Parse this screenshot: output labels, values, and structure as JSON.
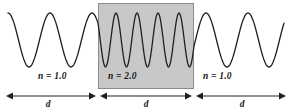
{
  "figure": {
    "background_color": "#ffffff",
    "width": 290,
    "height": 112
  },
  "slab": {
    "fill_color": "#c8c8c8",
    "border_color": "#8c8c8c",
    "x": 98,
    "y": 3,
    "width": 96,
    "height": 86
  },
  "wave": {
    "stroke_color": "#231f20",
    "stroke_width": 1.3,
    "baseline_y": 40,
    "amplitude": 27,
    "x_start": 8,
    "x_end": 284
  },
  "regions": [
    {
      "id": "left",
      "label": "n = 1.0",
      "index_of_refraction": 1.0,
      "wavelength_px": 42,
      "x_start": 8,
      "x_end": 98
    },
    {
      "id": "middle",
      "label": "n = 2.0",
      "index_of_refraction": 2.0,
      "wavelength_px": 21,
      "x_start": 98,
      "x_end": 194
    },
    {
      "id": "right",
      "label": "n = 1.0",
      "index_of_refraction": 1.0,
      "wavelength_px": 42,
      "x_start": 194,
      "x_end": 284
    }
  ],
  "dimensions": {
    "arrow_color": "#231f20",
    "arrow_y": 96,
    "items": [
      {
        "id": "dim-left",
        "label": "d",
        "x_start": 6,
        "x_end": 96
      },
      {
        "id": "dim-middle",
        "label": "d",
        "x_start": 100,
        "x_end": 192
      },
      {
        "id": "dim-right",
        "label": "d",
        "x_start": 196,
        "x_end": 286
      }
    ]
  },
  "chart_data": {
    "type": "line",
    "xlabel": "",
    "ylabel": "",
    "grid": false,
    "legend": "none",
    "annotations": [
      "n = 1.0",
      "n = 2.0",
      "n = 1.0",
      "d",
      "d",
      "d"
    ],
    "series": [
      {
        "name": "wave",
        "description": "Continuous sinusoid; wavelength halves inside the shaded slab where n = 2.0",
        "segments": [
          {
            "region": "left",
            "n": 1.0,
            "wavelength_px": 42,
            "x_range": [
              8,
              98
            ],
            "cycles": 2.14
          },
          {
            "region": "middle",
            "n": 2.0,
            "wavelength_px": 21,
            "x_range": [
              98,
              194
            ],
            "cycles": 4.57
          },
          {
            "region": "right",
            "n": 1.0,
            "wavelength_px": 42,
            "x_range": [
              194,
              284
            ],
            "cycles": 2.14
          }
        ]
      }
    ]
  }
}
